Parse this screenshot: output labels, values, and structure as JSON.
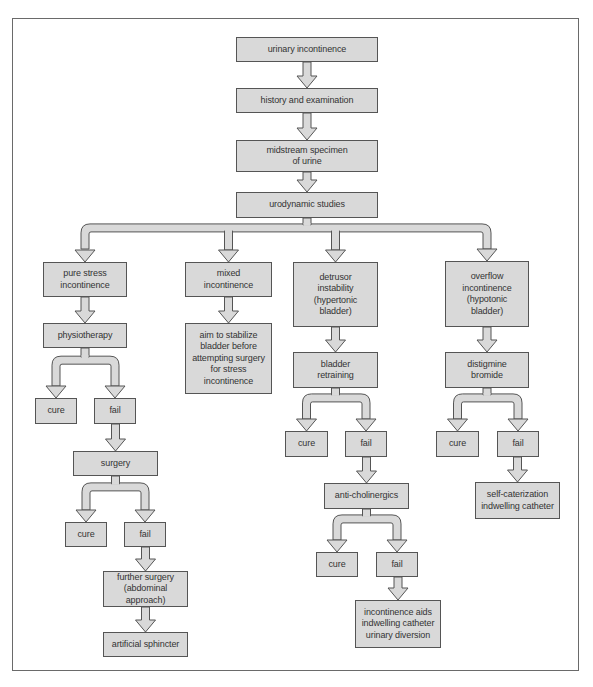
{
  "diagram": {
    "type": "flowchart",
    "colors": {
      "box_fill": "#d9d9d9",
      "box_border": "#555555",
      "arrow_fill": "#d9d9d9",
      "arrow_stroke": "#555555",
      "frame": "#6a6a6a"
    },
    "nodes": [
      {
        "id": "n_urinary",
        "label": "urinary incontinence",
        "x": 236,
        "y": 37,
        "w": 142,
        "h": 25
      },
      {
        "id": "n_history",
        "label": "history and examination",
        "x": 236,
        "y": 88,
        "w": 142,
        "h": 25
      },
      {
        "id": "n_midstream",
        "label": "midstream specimen\nof urine",
        "x": 236,
        "y": 140,
        "w": 142,
        "h": 32
      },
      {
        "id": "n_urodynamic",
        "label": "urodynamic studies",
        "x": 236,
        "y": 192,
        "w": 142,
        "h": 26
      },
      {
        "id": "n_pure",
        "label": "pure stress\nincontinence",
        "x": 43,
        "y": 262,
        "w": 84,
        "h": 35
      },
      {
        "id": "n_mixed",
        "label": "mixed\nincontinence",
        "x": 185,
        "y": 262,
        "w": 87,
        "h": 35
      },
      {
        "id": "n_detrusor",
        "label": "detrusor\ninstability\n(hypertonic\nbladder)",
        "x": 293,
        "y": 262,
        "w": 85,
        "h": 65
      },
      {
        "id": "n_overflow",
        "label": "overflow\nincontinence\n(hypotonic\nbladder)",
        "x": 445,
        "y": 261,
        "w": 84,
        "h": 66
      },
      {
        "id": "n_physio",
        "label": "physiotherapy",
        "x": 43,
        "y": 323,
        "w": 84,
        "h": 25
      },
      {
        "id": "n_aim",
        "label": "aim to stabilize\nbladder before\nattempting surgery\nfor stress\nincontinence",
        "x": 185,
        "y": 323,
        "w": 87,
        "h": 71
      },
      {
        "id": "n_bladder_retraining",
        "label": "bladder\nretraining",
        "x": 293,
        "y": 352,
        "w": 85,
        "h": 36
      },
      {
        "id": "n_distigmine",
        "label": "distigmine\nbromide",
        "x": 445,
        "y": 352,
        "w": 84,
        "h": 36
      },
      {
        "id": "n_cure1",
        "label": "cure",
        "x": 35,
        "y": 398,
        "w": 42,
        "h": 26
      },
      {
        "id": "n_fail1",
        "label": "fail",
        "x": 94,
        "y": 398,
        "w": 42,
        "h": 26
      },
      {
        "id": "n_surgery",
        "label": "surgery",
        "x": 73,
        "y": 451,
        "w": 85,
        "h": 25
      },
      {
        "id": "n_cure2",
        "label": "cure",
        "x": 65,
        "y": 522,
        "w": 42,
        "h": 25
      },
      {
        "id": "n_fail2",
        "label": "fail",
        "x": 124,
        "y": 522,
        "w": 42,
        "h": 25
      },
      {
        "id": "n_further",
        "label": "further surgery\n(abdominal approach)",
        "x": 103,
        "y": 571,
        "w": 85,
        "h": 36
      },
      {
        "id": "n_sphincter",
        "label": "artificial sphincter",
        "x": 103,
        "y": 632,
        "w": 85,
        "h": 25
      },
      {
        "id": "n_cure3",
        "label": "cure",
        "x": 285,
        "y": 431,
        "w": 43,
        "h": 26
      },
      {
        "id": "n_fail3",
        "label": "fail",
        "x": 345,
        "y": 431,
        "w": 42,
        "h": 26
      },
      {
        "id": "n_anticholinergics",
        "label": "anti-cholinergics",
        "x": 324,
        "y": 483,
        "w": 85,
        "h": 26
      },
      {
        "id": "n_cure4",
        "label": "cure",
        "x": 316,
        "y": 552,
        "w": 42,
        "h": 25
      },
      {
        "id": "n_fail4",
        "label": "fail",
        "x": 376,
        "y": 552,
        "w": 42,
        "h": 25
      },
      {
        "id": "n_aids",
        "label": "incontinence aids\nindwelling catheter\nurinary diversion",
        "x": 355,
        "y": 600,
        "w": 86,
        "h": 48
      },
      {
        "id": "n_cure5",
        "label": "cure",
        "x": 436,
        "y": 431,
        "w": 43,
        "h": 26
      },
      {
        "id": "n_fail5",
        "label": "fail",
        "x": 497,
        "y": 431,
        "w": 42,
        "h": 26
      },
      {
        "id": "n_selfcath",
        "label": "self-caterization\nindwelling catheter",
        "x": 475,
        "y": 482,
        "w": 85,
        "h": 37
      }
    ],
    "edges": [
      {
        "from": "n_urinary",
        "to": "n_history"
      },
      {
        "from": "n_history",
        "to": "n_midstream"
      },
      {
        "from": "n_midstream",
        "to": "n_urodynamic"
      },
      {
        "from": "n_urodynamic",
        "to": [
          "n_pure",
          "n_mixed",
          "n_detrusor",
          "n_overflow"
        ]
      },
      {
        "from": "n_pure",
        "to": "n_physio"
      },
      {
        "from": "n_mixed",
        "to": "n_aim"
      },
      {
        "from": "n_detrusor",
        "to": "n_bladder_retraining"
      },
      {
        "from": "n_overflow",
        "to": "n_distigmine"
      },
      {
        "from": "n_physio",
        "to": [
          "n_cure1",
          "n_fail1"
        ]
      },
      {
        "from": "n_fail1",
        "to": "n_surgery"
      },
      {
        "from": "n_surgery",
        "to": [
          "n_cure2",
          "n_fail2"
        ]
      },
      {
        "from": "n_fail2",
        "to": "n_further"
      },
      {
        "from": "n_further",
        "to": "n_sphincter"
      },
      {
        "from": "n_bladder_retraining",
        "to": [
          "n_cure3",
          "n_fail3"
        ]
      },
      {
        "from": "n_fail3",
        "to": "n_anticholinergics"
      },
      {
        "from": "n_anticholinergics",
        "to": [
          "n_cure4",
          "n_fail4"
        ]
      },
      {
        "from": "n_fail4",
        "to": "n_aids"
      },
      {
        "from": "n_distigmine",
        "to": [
          "n_cure5",
          "n_fail5"
        ]
      },
      {
        "from": "n_fail5",
        "to": "n_selfcath"
      }
    ]
  }
}
